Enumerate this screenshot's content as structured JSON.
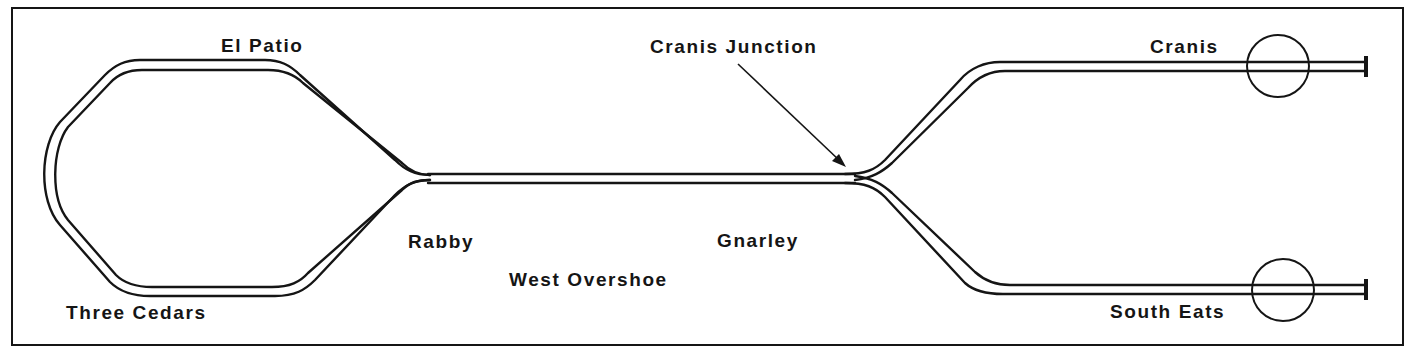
{
  "diagram": {
    "type": "railway-track-layout",
    "colors": {
      "ink": "#151515",
      "background": "#ffffff"
    },
    "stations": [
      {
        "id": "el-patio",
        "label": "El Patio"
      },
      {
        "id": "three-cedars",
        "label": "Three Cedars"
      },
      {
        "id": "rabby",
        "label": "Rabby"
      },
      {
        "id": "west-overshoe",
        "label": "West Overshoe"
      },
      {
        "id": "gnarley",
        "label": "Gnarley"
      },
      {
        "id": "cranis-junction",
        "label": "Cranis Junction"
      },
      {
        "id": "cranis",
        "label": "Cranis"
      },
      {
        "id": "south-eats",
        "label": "South Eats"
      }
    ],
    "annotations": {
      "cranis_junction_arrow": "points to junction where main line splits toward Cranis and South Eats"
    },
    "terminals": [
      {
        "station": "cranis",
        "marker": "circle",
        "end": "buffer-stop"
      },
      {
        "station": "south-eats",
        "marker": "circle",
        "end": "buffer-stop"
      }
    ]
  }
}
